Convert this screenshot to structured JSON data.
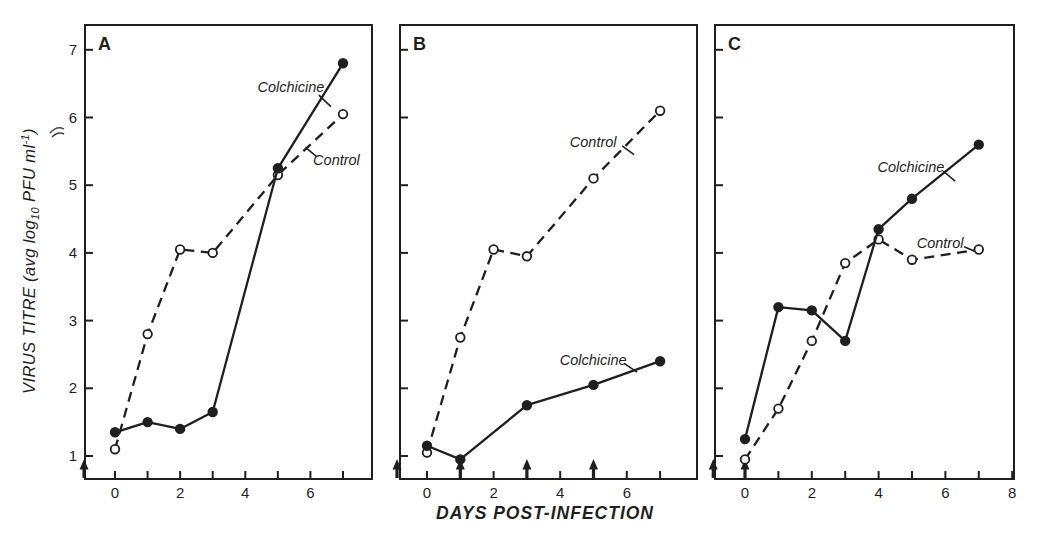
{
  "figure": {
    "background": "#ffffff",
    "ink_color": "#1f1f1f",
    "y_axis_label": {
      "prefix": "VIRUS TITRE (avg log",
      "subscript": "10",
      "middle": " PFU ml",
      "superscript": "-1",
      "suffix": ")"
    },
    "x_axis_label": "DAYS POST-INFECTION"
  },
  "chart_data": [
    {
      "type": "line",
      "panel_label": "A",
      "xlabel": "DAYS POST-INFECTION",
      "ylabel": "VIRUS TITRE (avg log10 PFU ml-1)",
      "xlim": [
        -0.9,
        7.9
      ],
      "ylim": [
        0.65,
        7.35
      ],
      "grid": false,
      "x_ticks": [
        0,
        1,
        2,
        3,
        4,
        5,
        6,
        7
      ],
      "x_labeled_ticks": [
        0,
        2,
        4,
        6
      ],
      "y_ticks": [
        1,
        2,
        3,
        4,
        5,
        6,
        7
      ],
      "y_tick_labels_visible": true,
      "series": [
        {
          "name": "Control",
          "marker": "open-circle",
          "line": "dashed",
          "x": [
            0,
            1,
            2,
            3,
            5,
            7
          ],
          "y": [
            1.1,
            2.8,
            4.05,
            4.0,
            5.15,
            6.05
          ]
        },
        {
          "name": "Colchicine",
          "marker": "filled-circle",
          "line": "solid",
          "x": [
            0,
            1,
            2,
            3,
            5,
            7
          ],
          "y": [
            1.35,
            1.5,
            1.4,
            1.65,
            5.25,
            6.8
          ]
        }
      ],
      "annotations": [
        {
          "text": "Colchicine",
          "x": 5.4,
          "y": 6.45,
          "conn": [
            [
              6.26,
              6.33
            ],
            [
              6.63,
              6.16
            ]
          ]
        },
        {
          "text": "Control",
          "x": 6.8,
          "y": 5.37,
          "conn": [
            [
              6.2,
              5.42
            ],
            [
              5.85,
              5.56
            ]
          ]
        }
      ],
      "treatment_arrows_days": [
        -0.95
      ]
    },
    {
      "type": "line",
      "panel_label": "B",
      "xlabel": "DAYS POST-INFECTION",
      "ylabel": "VIRUS TITRE (avg log10 PFU ml-1)",
      "xlim": [
        -0.8,
        8.1
      ],
      "ylim": [
        0.65,
        7.35
      ],
      "grid": false,
      "x_ticks": [
        0,
        1,
        2,
        3,
        4,
        5,
        6,
        7
      ],
      "x_labeled_ticks": [
        0,
        2,
        4,
        6
      ],
      "y_ticks": [
        1,
        2,
        3,
        4,
        5,
        6,
        7
      ],
      "y_tick_labels_visible": false,
      "series": [
        {
          "name": "Control",
          "marker": "open-circle",
          "line": "dashed",
          "x": [
            0,
            1,
            2,
            3,
            5,
            7
          ],
          "y": [
            1.05,
            2.75,
            4.05,
            3.95,
            5.1,
            6.1
          ]
        },
        {
          "name": "Colchicine",
          "marker": "filled-circle",
          "line": "solid",
          "x": [
            0,
            1,
            3,
            5,
            7
          ],
          "y": [
            1.15,
            0.95,
            1.75,
            2.05,
            2.4
          ]
        }
      ],
      "annotations": [
        {
          "text": "Control",
          "x": 4.99,
          "y": 5.64,
          "conn": [
            [
              5.86,
              5.58
            ],
            [
              6.22,
              5.45
            ]
          ]
        },
        {
          "text": "Colchicine",
          "x": 4.99,
          "y": 2.42,
          "conn": [
            [
              5.92,
              2.37
            ],
            [
              6.31,
              2.24
            ]
          ]
        }
      ],
      "treatment_arrows_days": [
        -0.9,
        1,
        3,
        5
      ]
    },
    {
      "type": "line",
      "panel_label": "C",
      "xlabel": "DAYS POST-INFECTION",
      "ylabel": "VIRUS TITRE (avg log10 PFU ml-1)",
      "xlim": [
        -0.9,
        8.05
      ],
      "ylim": [
        0.65,
        7.35
      ],
      "grid": false,
      "x_ticks": [
        0,
        1,
        2,
        3,
        4,
        5,
        6,
        7,
        8
      ],
      "x_labeled_ticks": [
        0,
        2,
        4,
        6,
        8
      ],
      "y_ticks": [
        1,
        2,
        3,
        4,
        5,
        6,
        7
      ],
      "y_tick_labels_visible": false,
      "series": [
        {
          "name": "Control",
          "marker": "open-circle",
          "line": "dashed",
          "x": [
            0,
            1,
            2,
            3,
            4,
            5,
            7
          ],
          "y": [
            0.95,
            1.7,
            2.7,
            3.85,
            4.2,
            3.9,
            4.05
          ]
        },
        {
          "name": "Colchicine",
          "marker": "filled-circle",
          "line": "solid",
          "x": [
            0,
            1,
            2,
            3,
            4,
            5,
            7
          ],
          "y": [
            1.25,
            3.2,
            3.15,
            2.7,
            4.35,
            4.8,
            5.6
          ]
        }
      ],
      "annotations": [
        {
          "text": "Colchicine",
          "x": 4.97,
          "y": 5.27,
          "conn": [
            [
              5.93,
              5.21
            ],
            [
              6.29,
              5.06
            ]
          ]
        },
        {
          "text": "Control",
          "x": 5.84,
          "y": 4.15,
          "conn": [
            [
              6.56,
              4.09
            ],
            [
              6.86,
              4.03
            ]
          ]
        }
      ],
      "treatment_arrows_days": [
        -0.95,
        0
      ]
    }
  ]
}
